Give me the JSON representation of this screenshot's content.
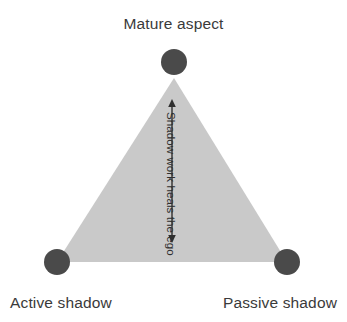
{
  "diagram": {
    "type": "triangle-relationship-diagram",
    "title": "Mature aspect",
    "background_color": "#ffffff",
    "triangle": {
      "fill_color": "#c9c9c9",
      "apex": {
        "x": 174,
        "y": 78,
        "label": "Mature aspect"
      },
      "bottom_left": {
        "x": 57,
        "y": 262,
        "label": "Active shadow"
      },
      "bottom_right": {
        "x": 287,
        "y": 262,
        "label": "Passive shadow"
      }
    },
    "nodes": [
      {
        "id": "mature-aspect",
        "label": "Mature aspect",
        "color": "#4a4a4a",
        "radius": 13,
        "cx": 174,
        "cy": 62
      },
      {
        "id": "active-shadow",
        "label": "Active shadow",
        "color": "#4a4a4a",
        "radius": 13,
        "cx": 57,
        "cy": 262
      },
      {
        "id": "passive-shadow",
        "label": "Passive shadow",
        "color": "#4a4a4a",
        "radius": 13,
        "cx": 287,
        "cy": 262
      }
    ],
    "arrow": {
      "caption": "Shadow work heals the ego",
      "color": "#2f2f2f",
      "orientation": "vertical",
      "double_headed": true,
      "x": 172,
      "y_top": 100,
      "y_bottom": 242
    },
    "labels": {
      "title": "Mature aspect",
      "bottom_left": "Active shadow",
      "bottom_right": "Passive shadow",
      "arrow_caption": "Shadow work heals the ego"
    },
    "colors": {
      "node": "#4a4a4a",
      "triangle_fill": "#c9c9c9",
      "text": "#3a3a3a",
      "arrow": "#2f2f2f",
      "background": "#ffffff"
    }
  }
}
